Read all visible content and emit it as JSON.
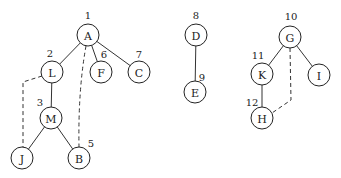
{
  "diagram": {
    "type": "dfs-forest",
    "node_radius": 11,
    "nodes": [
      {
        "id": "A",
        "label": "A",
        "order": "1",
        "x": 88,
        "y": 35,
        "num_x": 88,
        "num_y": 19
      },
      {
        "id": "L",
        "label": "L",
        "order": "2",
        "x": 52,
        "y": 72,
        "num_x": 50,
        "num_y": 57
      },
      {
        "id": "M",
        "label": "M",
        "order": "3",
        "x": 51,
        "y": 118,
        "num_x": 40,
        "num_y": 106
      },
      {
        "id": "J",
        "label": "J",
        "order": "",
        "x": 22,
        "y": 158,
        "num_x": 0,
        "num_y": 0
      },
      {
        "id": "B",
        "label": "B",
        "order": "5",
        "x": 79,
        "y": 158,
        "num_x": 91,
        "num_y": 147
      },
      {
        "id": "F",
        "label": "F",
        "order": "6",
        "x": 101,
        "y": 72,
        "num_x": 104,
        "num_y": 58
      },
      {
        "id": "C",
        "label": "C",
        "order": "7",
        "x": 139,
        "y": 72,
        "num_x": 139,
        "num_y": 58
      },
      {
        "id": "D",
        "label": "D",
        "order": "8",
        "x": 196,
        "y": 35,
        "num_x": 196,
        "num_y": 19
      },
      {
        "id": "E",
        "label": "E",
        "order": "9",
        "x": 195,
        "y": 92,
        "num_x": 202,
        "num_y": 81
      },
      {
        "id": "G",
        "label": "G",
        "order": "10",
        "x": 290,
        "y": 37,
        "num_x": 291,
        "num_y": 20
      },
      {
        "id": "K",
        "label": "K",
        "order": "11",
        "x": 262,
        "y": 74,
        "num_x": 258,
        "num_y": 59
      },
      {
        "id": "I",
        "label": "I",
        "order": "",
        "x": 319,
        "y": 75,
        "num_x": 0,
        "num_y": 0
      },
      {
        "id": "H",
        "label": "H",
        "order": "12",
        "x": 262,
        "y": 118,
        "num_x": 252,
        "num_y": 106
      }
    ],
    "tree_edges": [
      {
        "from": "A",
        "to": "L"
      },
      {
        "from": "A",
        "to": "F"
      },
      {
        "from": "A",
        "to": "C"
      },
      {
        "from": "L",
        "to": "M"
      },
      {
        "from": "M",
        "to": "J"
      },
      {
        "from": "M",
        "to": "B"
      },
      {
        "from": "D",
        "to": "E"
      },
      {
        "from": "G",
        "to": "K"
      },
      {
        "from": "G",
        "to": "I"
      },
      {
        "from": "K",
        "to": "H"
      }
    ],
    "back_edges": [
      {
        "from": "L",
        "to": "J",
        "path": "M 42 76 L 23 82 L 23 147"
      },
      {
        "from": "A",
        "to": "B",
        "path": "M 86 46 Q 78 90 79 147"
      },
      {
        "from": "G",
        "to": "H",
        "path": "M 290 48 L 291 100 L 272 113"
      }
    ]
  }
}
